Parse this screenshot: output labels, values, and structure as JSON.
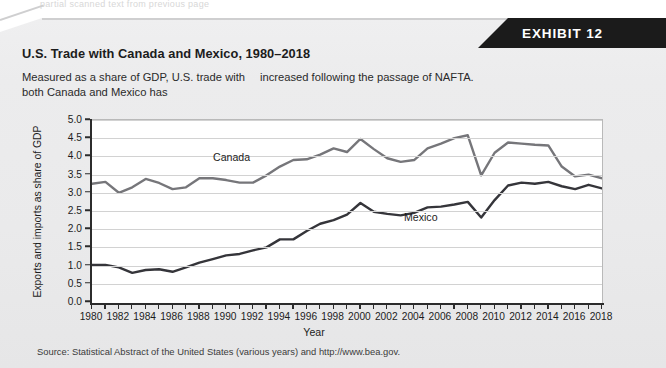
{
  "page": {
    "ghost_text": "partial scanned text from previous page",
    "exhibit_badge": "EXHIBIT 12",
    "title": "U.S. Trade with Canada and Mexico, 1980–2018",
    "subtitle_col1": "Measured as a share of GDP, U.S. trade with both Canada and Mexico has",
    "subtitle_col2": "increased following the passage of NAFTA.",
    "source": "Source: Statistical Abstract of the United States (various years) and http://www.bea.gov."
  },
  "colors": {
    "panel_background": "#ebebec",
    "badge_background": "#1b1b1b",
    "badge_text": "#ffffff",
    "plot_background": "#ffffff",
    "gridline": "#d2d2d2",
    "axis": "#2c2c2c",
    "canada_line": "#76767a",
    "mexico_line": "#35353a",
    "text": "#1c1c1c"
  },
  "chart_data": {
    "type": "line",
    "title": "U.S. Trade with Canada and Mexico, 1980–2018",
    "xlabel": "Year",
    "ylabel": "Exports and imports as share of GDP",
    "xlim": [
      1980,
      2018
    ],
    "ylim": [
      0.0,
      5.0
    ],
    "grid": true,
    "legend_position": "inline-labels",
    "ytick_labels": [
      "0.0",
      "0.5",
      "1.0",
      "1.5",
      "2.0",
      "2.5",
      "3.0",
      "3.5",
      "4.0",
      "4.5",
      "5.0"
    ],
    "ytick_values": [
      0.0,
      0.5,
      1.0,
      1.5,
      2.0,
      2.5,
      3.0,
      3.5,
      4.0,
      4.5,
      5.0
    ],
    "xtick_labels": [
      "1980",
      "1982",
      "1984",
      "1986",
      "1988",
      "1990",
      "1992",
      "1994",
      "1996",
      "1998",
      "2000",
      "2002",
      "2004",
      "2006",
      "2008",
      "2010",
      "2012",
      "2014",
      "2016",
      "2018"
    ],
    "xtick_values": [
      1980,
      1982,
      1984,
      1986,
      1988,
      1990,
      1992,
      1994,
      1996,
      1998,
      2000,
      2002,
      2004,
      2006,
      2008,
      2010,
      2012,
      2014,
      2016,
      2018
    ],
    "minor_xticks": [
      1981,
      1983,
      1985,
      1987,
      1989,
      1991,
      1993,
      1995,
      1997,
      1999,
      2001,
      2003,
      2005,
      2007,
      2009,
      2011,
      2013,
      2015,
      2017
    ],
    "x": [
      1980,
      1981,
      1982,
      1983,
      1984,
      1985,
      1986,
      1987,
      1988,
      1989,
      1990,
      1991,
      1992,
      1993,
      1994,
      1995,
      1996,
      1997,
      1998,
      1999,
      2000,
      2001,
      2002,
      2003,
      2004,
      2005,
      2006,
      2007,
      2008,
      2009,
      2010,
      2011,
      2012,
      2013,
      2014,
      2015,
      2016,
      2017,
      2018
    ],
    "series": [
      {
        "name": "Canada",
        "color": "#76767a",
        "label_x": 1990,
        "label_y": 3.85,
        "values": [
          3.25,
          3.3,
          3.0,
          3.15,
          3.38,
          3.27,
          3.1,
          3.15,
          3.4,
          3.4,
          3.35,
          3.28,
          3.28,
          3.48,
          3.72,
          3.9,
          3.92,
          4.05,
          4.22,
          4.12,
          4.48,
          4.2,
          3.95,
          3.85,
          3.9,
          4.22,
          4.35,
          4.5,
          4.58,
          3.48,
          4.1,
          4.38,
          4.35,
          4.32,
          4.3,
          3.72,
          3.45,
          3.5,
          3.4
        ]
      },
      {
        "name": "Mexico",
        "color": "#35353a",
        "label_x": 2004,
        "label_y": 2.22,
        "values": [
          1.02,
          1.02,
          0.95,
          0.8,
          0.88,
          0.9,
          0.83,
          0.95,
          1.08,
          1.18,
          1.28,
          1.32,
          1.42,
          1.5,
          1.72,
          1.72,
          1.95,
          2.15,
          2.25,
          2.4,
          2.72,
          2.48,
          2.42,
          2.38,
          2.45,
          2.6,
          2.62,
          2.68,
          2.75,
          2.32,
          2.8,
          3.2,
          3.28,
          3.25,
          3.3,
          3.18,
          3.1,
          3.22,
          3.12
        ]
      }
    ]
  }
}
